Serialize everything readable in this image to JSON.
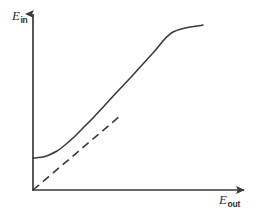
{
  "figure": {
    "background_color": "#ffffff",
    "stroke_color": "#3a3a3a",
    "axes": {
      "y": {
        "symbol": "E",
        "subscript": "in",
        "full_label": "E_in",
        "has_arrow": true,
        "direction": "up"
      },
      "x": {
        "symbol": "E",
        "subscript": "out",
        "full_label": "E_out",
        "has_arrow": true,
        "direction": "right"
      }
    }
  },
  "chart_data": {
    "type": "line",
    "title": "",
    "xlabel": "E_out",
    "ylabel": "E_in",
    "xlim": [
      0,
      1
    ],
    "ylim": [
      0,
      1
    ],
    "grid": false,
    "legend": null,
    "axis_origin_px": [
      33,
      190
    ],
    "series": [
      {
        "name": "response curve",
        "style": "solid",
        "color": "#3a3a3a",
        "width_px": 1.6,
        "description": "Saturating-offset curve: starts at a positive E_in intercept with zero slope, bends upward and becomes asymptotically linear.",
        "x": [
          0.0,
          0.02,
          0.05,
          0.08,
          0.12,
          0.16,
          0.2,
          0.25,
          0.3,
          0.36,
          0.42,
          0.5,
          0.6,
          0.7,
          0.79
        ],
        "y": [
          0.185,
          0.186,
          0.192,
          0.203,
          0.225,
          0.256,
          0.292,
          0.341,
          0.392,
          0.455,
          0.518,
          0.602,
          0.707,
          0.812,
          0.907
        ],
        "points_px": [
          [
            33,
            158
          ],
          [
            37,
            157.7
          ],
          [
            43,
            157
          ],
          [
            49,
            155
          ],
          [
            57,
            151
          ],
          [
            65,
            145
          ],
          [
            73,
            138
          ],
          [
            83,
            128
          ],
          [
            93,
            118
          ],
          [
            105,
            105
          ],
          [
            117,
            92
          ],
          [
            133,
            75
          ],
          [
            153,
            53
          ],
          [
            173,
            32
          ],
          [
            203,
            25
          ]
        ]
      },
      {
        "name": "linear asymptote",
        "style": "dashed",
        "color": "#3a3a3a",
        "width_px": 1.6,
        "dash_pattern_px": "8 5",
        "description": "Straight dashed line through the origin, tangent to the linear part of the solid curve.",
        "x": [
          0.0,
          0.4
        ],
        "y": [
          0.0,
          0.43
        ],
        "points_px": [
          [
            33,
            190
          ],
          [
            120,
            116
          ]
        ]
      }
    ]
  }
}
